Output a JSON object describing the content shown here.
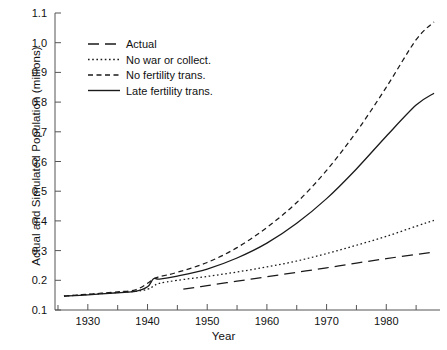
{
  "chart_data": {
    "type": "line",
    "title": "",
    "xlabel": "Year",
    "ylabel": "Actual and Simulated Population (millions)",
    "xlim": [
      1924.5,
      1989
    ],
    "ylim": [
      0.1,
      1.1
    ],
    "grid": false,
    "legend_position": "top-left",
    "yticks": [
      "0.1",
      "0.2",
      "0.3",
      "0.4",
      "0.5",
      "0.6",
      "0.7",
      "0.8",
      "0.9",
      "1.0",
      "1.1"
    ],
    "ytick_values": [
      0.1,
      0.2,
      0.3,
      0.4,
      0.5,
      0.6,
      0.7,
      0.8,
      0.9,
      1.0,
      1.1
    ],
    "xticks": [
      "1930",
      "1940",
      "1950",
      "1960",
      "1970",
      "1980"
    ],
    "xtick_values": [
      1930,
      1940,
      1950,
      1960,
      1970,
      1980
    ],
    "xtick_minor_values": [
      1925,
      1935,
      1945,
      1955,
      1965,
      1975,
      1985
    ],
    "series": [
      {
        "name": "Actual",
        "style": "long-dash",
        "x": [
          1946,
          1950,
          1955,
          1960,
          1965,
          1970,
          1975,
          1980,
          1985,
          1988
        ],
        "values": [
          0.17,
          0.182,
          0.197,
          0.212,
          0.227,
          0.242,
          0.258,
          0.273,
          0.287,
          0.295
        ]
      },
      {
        "name": "No war or collect.",
        "style": "dotted",
        "x": [
          1926,
          1930,
          1935,
          1938,
          1940,
          1941,
          1942,
          1945,
          1950,
          1955,
          1960,
          1965,
          1970,
          1975,
          1980,
          1985,
          1988
        ],
        "values": [
          0.147,
          0.152,
          0.159,
          0.163,
          0.17,
          0.18,
          0.19,
          0.2,
          0.213,
          0.228,
          0.245,
          0.265,
          0.29,
          0.318,
          0.348,
          0.382,
          0.402
        ]
      },
      {
        "name": "No fertility trans.",
        "style": "short-dash",
        "x": [
          1926,
          1930,
          1935,
          1938,
          1940,
          1941,
          1942,
          1945,
          1950,
          1955,
          1960,
          1965,
          1970,
          1975,
          1980,
          1985,
          1988
        ],
        "values": [
          0.147,
          0.153,
          0.161,
          0.168,
          0.19,
          0.205,
          0.212,
          0.227,
          0.26,
          0.31,
          0.378,
          0.462,
          0.57,
          0.7,
          0.85,
          1.01,
          1.07
        ]
      },
      {
        "name": "Late fertility trans.",
        "style": "solid",
        "x": [
          1926,
          1930,
          1935,
          1938,
          1940,
          1941,
          1942,
          1945,
          1950,
          1955,
          1960,
          1965,
          1970,
          1975,
          1980,
          1985,
          1988
        ],
        "values": [
          0.147,
          0.151,
          0.158,
          0.163,
          0.178,
          0.205,
          0.204,
          0.214,
          0.238,
          0.275,
          0.325,
          0.392,
          0.475,
          0.575,
          0.685,
          0.79,
          0.83
        ]
      }
    ]
  },
  "legend": {
    "items": [
      {
        "label": "Actual",
        "style": "long-dash"
      },
      {
        "label": "No war or collect.",
        "style": "dotted"
      },
      {
        "label": "No fertility trans.",
        "style": "short-dash"
      },
      {
        "label": "Late fertility trans.",
        "style": "solid"
      }
    ]
  },
  "colors": {
    "line": "#1a1a1a",
    "axis": "#555555",
    "background": "#ffffff"
  }
}
